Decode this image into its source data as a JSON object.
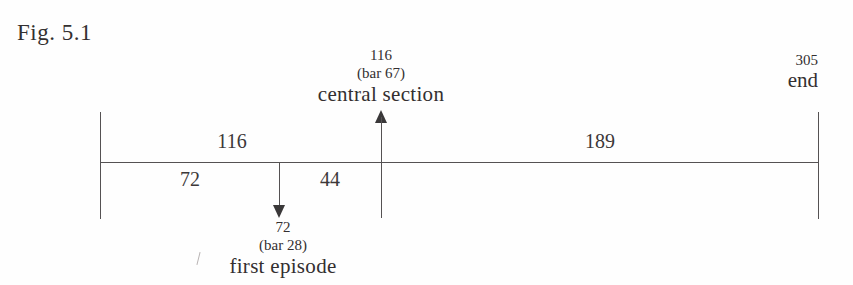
{
  "figure": {
    "caption": "Fig. 5.1",
    "type": "timeline-proportion-diagram"
  },
  "axis": {
    "start_label": "",
    "end_value": "305",
    "end_name": "end"
  },
  "segments": {
    "total_upper": "116",
    "first": "72",
    "second": "44",
    "third": "189"
  },
  "markers": {
    "central_section": {
      "value": "116",
      "bar": "(bar 67)",
      "name": "central section"
    },
    "first_episode": {
      "value": "72",
      "bar": "(bar 28)",
      "name": "first episode"
    }
  },
  "chart_data": {
    "type": "bar",
    "title": "Fig. 5.1",
    "xlabel": "",
    "ylabel": "",
    "categories": [
      "72",
      "44",
      "189"
    ],
    "values": [
      72,
      44,
      189
    ],
    "annotations": [
      "116",
      "(bar 67)",
      "central section",
      "72",
      "(bar 28)",
      "first episode",
      "305",
      "end"
    ],
    "axis_total": 305,
    "tick_positions": [
      0,
      72,
      116,
      305
    ],
    "tick_labels": [
      "",
      "72",
      "116",
      "305"
    ],
    "grid": false,
    "legend": "none"
  }
}
